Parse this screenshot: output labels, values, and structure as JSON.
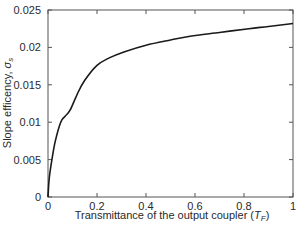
{
  "chart_data": {
    "type": "line",
    "title": "",
    "xlabel": "Transmittance of the output coupler (T_F)",
    "xlabel_main": "Transmittance of the output coupler (",
    "xlabel_symbol": "T",
    "xlabel_subscript": "F",
    "xlabel_close": ")",
    "ylabel": "Slope efficency, σ_s",
    "ylabel_main": "Slope efficency, ",
    "ylabel_symbol": "σ",
    "ylabel_subscript": "s",
    "xlim": [
      0,
      1
    ],
    "ylim": [
      0,
      0.025
    ],
    "xticks": [
      0,
      0.2,
      0.4,
      0.6,
      0.8,
      1
    ],
    "xtick_labels": [
      "0",
      "0.2",
      "0.4",
      "0.6",
      "0.8",
      "1"
    ],
    "yticks": [
      0,
      0.005,
      0.01,
      0.015,
      0.02,
      0.025
    ],
    "ytick_labels": [
      "0",
      "0.005",
      "0.01",
      "0.015",
      "0.02",
      "0.025"
    ],
    "grid": false,
    "legend": null,
    "series": [
      {
        "name": "slope efficiency",
        "color": "#1a1a1a",
        "x": [
          0,
          0.005,
          0.016,
          0.03,
          0.052,
          0.07,
          0.09,
          0.12,
          0.15,
          0.2,
          0.25,
          0.31,
          0.4,
          0.5,
          0.58,
          0.7,
          0.82,
          0.9,
          1.0
        ],
        "y": [
          0,
          0.0025,
          0.005,
          0.0075,
          0.01,
          0.0108,
          0.0116,
          0.0138,
          0.0156,
          0.0176,
          0.0186,
          0.0194,
          0.0203,
          0.021,
          0.0215,
          0.022,
          0.0225,
          0.0228,
          0.0232
        ]
      }
    ]
  }
}
